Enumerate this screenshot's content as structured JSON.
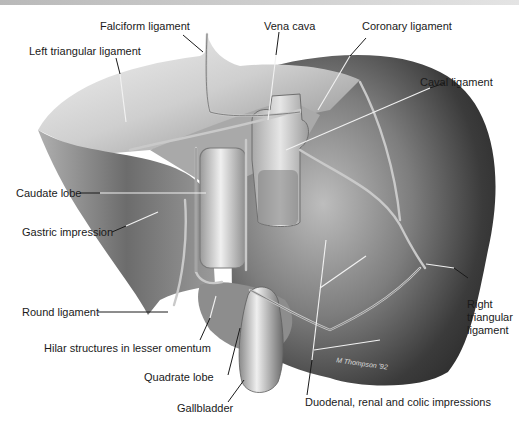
{
  "figure": {
    "signature": "M Thompson '92",
    "labels": {
      "falciform": "Falciform ligament",
      "left_triangular": "Left triangular ligament",
      "vena_cava": "Vena cava",
      "coronary": "Coronary ligament",
      "caval": "Caval ligament",
      "caudate": "Caudate lobe",
      "gastric": "Gastric impression",
      "round": "Round ligament",
      "hilar": "Hilar structures in lesser omentum",
      "quadrate": "Quadrate lobe",
      "gallbladder": "Gallbladder",
      "duodenal": "Duodenal, renal and colic impressions",
      "right_triangular": "Right triangular ligament"
    }
  },
  "colors": {
    "label_text": "#1a1a1a",
    "leader_dark": "#1a1a1a",
    "leader_light": "#f0f0f0",
    "organ_light": "#e8e8e8",
    "organ_mid": "#9a9a9a",
    "organ_dark": "#3a3a3a"
  }
}
